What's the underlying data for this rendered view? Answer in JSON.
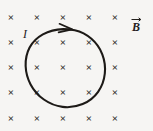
{
  "figure": {
    "background_color": "#f6f5f3",
    "ink_color": "#1d1a17",
    "width": 153,
    "height": 131
  },
  "field": {
    "symbol": "×",
    "meaning": "magnetic-field-into-page",
    "label": "B",
    "label_with_vector": "B⃗",
    "vector_notation": true,
    "label_x": 134,
    "label_y": 28,
    "grid": {
      "columns": 5,
      "rows": 5,
      "x_positions": [
        11,
        37,
        63,
        89,
        115
      ],
      "y_positions": [
        21,
        46,
        71,
        96,
        122
      ],
      "spacing_x": 26,
      "spacing_y": 25
    }
  },
  "loop": {
    "label": "I",
    "label_meaning": "current",
    "label_x": 25,
    "label_y": 37,
    "center_x": 64.5,
    "center_y": 68,
    "radius": 39,
    "direction": "clockwise",
    "arrowhead_angle_deg": -75
  }
}
